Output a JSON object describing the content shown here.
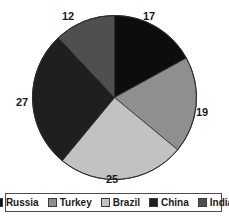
{
  "chart_data": {
    "type": "pie",
    "title": "",
    "categories": [
      "Russia",
      "Turkey",
      "Brazil",
      "China",
      "India"
    ],
    "values": [
      17,
      19,
      25,
      27,
      12
    ],
    "labels": [
      "17",
      "19",
      "25",
      "27",
      "12"
    ],
    "colors": [
      "#0d0d0d",
      "#8f8f8f",
      "#c2c2c2",
      "#1f1f1f",
      "#4f4f4f"
    ],
    "total": 100,
    "start_angle_deg": 0,
    "direction": "clockwise",
    "legend_position": "bottom",
    "grid": false,
    "xlabel": "",
    "ylabel": ""
  },
  "legend": {
    "items": [
      {
        "label": "Russia",
        "color": "#0d0d0d"
      },
      {
        "label": "Turkey",
        "color": "#8f8f8f"
      },
      {
        "label": "Brazil",
        "color": "#c2c2c2"
      },
      {
        "label": "China",
        "color": "#1f1f1f"
      },
      {
        "label": "India",
        "color": "#4f4f4f"
      }
    ]
  },
  "labels": {
    "russia": "17",
    "turkey": "19",
    "brazil": "25",
    "china": "27",
    "india": "12"
  }
}
